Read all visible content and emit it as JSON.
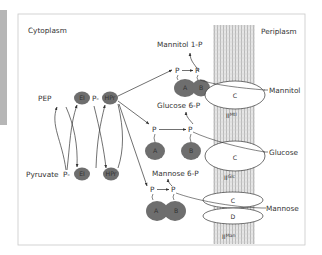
{
  "regions": {
    "cytoplasm": "Cytoplasm",
    "periplasm": "Periplasm"
  },
  "cycle": {
    "pep": "PEP",
    "pyruvate": "Pyruvate",
    "phospho_prefix": "P-",
    "ei_label": "EI",
    "hpr_label": "HPr"
  },
  "systems": [
    {
      "id": "mannitol",
      "substrate": "Mannitol",
      "product": "Mannitol 1-P",
      "domains": [
        "A",
        "B",
        "C"
      ],
      "phosphate_labels": [
        "P",
        "P"
      ],
      "transporter_base": "II",
      "transporter_sup": "Mtl"
    },
    {
      "id": "glucose",
      "substrate": "Glucose",
      "product": "Glucose 6-P",
      "domains": [
        "A",
        "B",
        "C"
      ],
      "phosphate_labels": [
        "P",
        "P"
      ],
      "transporter_base": "II",
      "transporter_sup": "Glc"
    },
    {
      "id": "mannose",
      "substrate": "Mannose",
      "product": "Mannose 6-P",
      "domains": [
        "A",
        "B",
        "C",
        "D"
      ],
      "phosphate_labels": [
        "P",
        "P"
      ],
      "transporter_base": "II",
      "transporter_sup": "Man"
    }
  ],
  "colors": {
    "protein_fill": "#6e6e6e",
    "protein_text": "#3a3a3a",
    "membrane": "#d9d9d9",
    "frame": "#c8c8c8",
    "line": "#333333",
    "side_strip": "#a9a9a9"
  }
}
